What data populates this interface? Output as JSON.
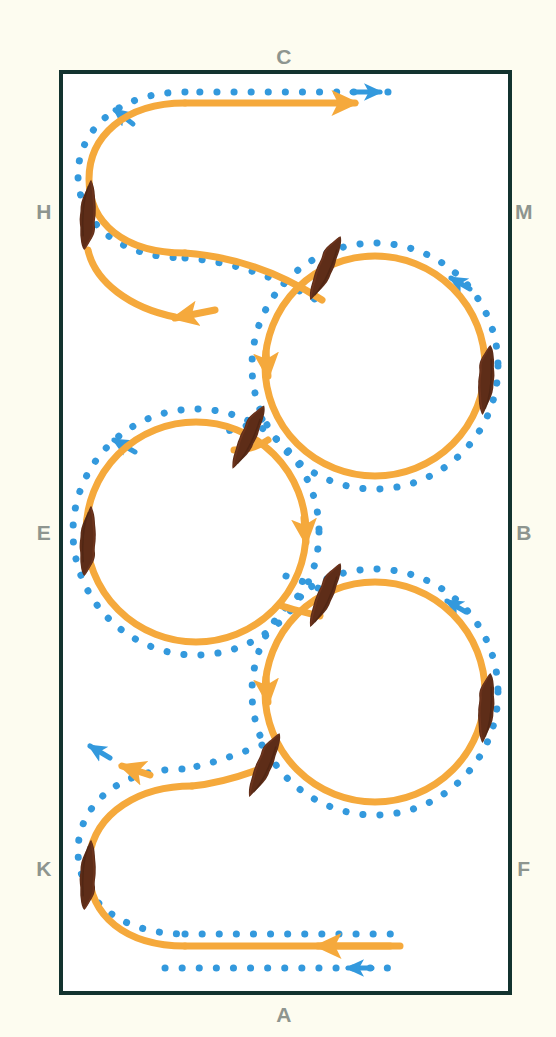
{
  "diagram": {
    "background_color": "#fdfcf0",
    "arena": {
      "fill": "#ffffff",
      "border_color": "#13332f",
      "border_width": 4,
      "x": 61,
      "y": 72,
      "width": 449,
      "height": 921
    },
    "colors": {
      "track_orange": "#f5a93c",
      "dots_blue": "#3399dd",
      "horse_brown": "#5e2d18",
      "letter_gray": "#8e958f",
      "arena_border": "#13332f",
      "arena_fill": "#ffffff",
      "page_background": "#fdfcf0"
    },
    "markers": [
      {
        "label": "C",
        "position": "top-center",
        "x": 284,
        "y": 64
      },
      {
        "label": "H",
        "position": "left-upper",
        "x": 44,
        "y": 219
      },
      {
        "label": "M",
        "position": "right-upper",
        "x": 524,
        "y": 219
      },
      {
        "label": "E",
        "position": "left-middle",
        "x": 44,
        "y": 540
      },
      {
        "label": "B",
        "position": "right-middle",
        "x": 524,
        "y": 540
      },
      {
        "label": "K",
        "position": "left-lower",
        "x": 44,
        "y": 876
      },
      {
        "label": "F",
        "position": "right-lower",
        "x": 524,
        "y": 876
      },
      {
        "label": "A",
        "position": "bottom-center",
        "x": 284,
        "y": 1022
      }
    ],
    "circles": [
      {
        "name": "circle-upper-right",
        "cx": 375,
        "cy": 366,
        "r": 110,
        "direction": "clockwise"
      },
      {
        "name": "circle-middle-left",
        "cx": 196,
        "cy": 532,
        "r": 110,
        "direction": "clockwise"
      },
      {
        "name": "circle-lower-right",
        "cx": 375,
        "cy": 692,
        "r": 110,
        "direction": "clockwise"
      }
    ],
    "horses": [
      {
        "name": "horse-left-upper",
        "x": 88,
        "y": 215,
        "angle": 5,
        "len": 72,
        "wid": 21
      },
      {
        "name": "horse-circle1-top",
        "x": 325,
        "y": 268,
        "angle": 205,
        "len": 72,
        "wid": 21
      },
      {
        "name": "horse-circle1-right",
        "x": 486,
        "y": 380,
        "angle": 186,
        "len": 72,
        "wid": 21
      },
      {
        "name": "horse-circle2-top",
        "x": 248,
        "y": 437,
        "angle": 206,
        "len": 72,
        "wid": 21
      },
      {
        "name": "horse-circle2-left",
        "x": 88,
        "y": 541,
        "angle": 5,
        "len": 72,
        "wid": 21
      },
      {
        "name": "horse-circle3-top",
        "x": 325,
        "y": 595,
        "angle": 205,
        "len": 72,
        "wid": 21
      },
      {
        "name": "horse-circle3-right",
        "x": 486,
        "y": 708,
        "angle": 186,
        "len": 72,
        "wid": 21
      },
      {
        "name": "horse-left-lower",
        "x": 88,
        "y": 875,
        "angle": 5,
        "len": 72,
        "wid": 21
      },
      {
        "name": "horse-bottom-loop",
        "x": 264,
        "y": 765,
        "angle": 205,
        "len": 72,
        "wid": 21
      }
    ],
    "legend": {
      "orange_line_meaning": "horse track / path of travel",
      "blue_dots_meaning": "rider inside track line",
      "arrow_meaning": "direction of movement"
    }
  }
}
